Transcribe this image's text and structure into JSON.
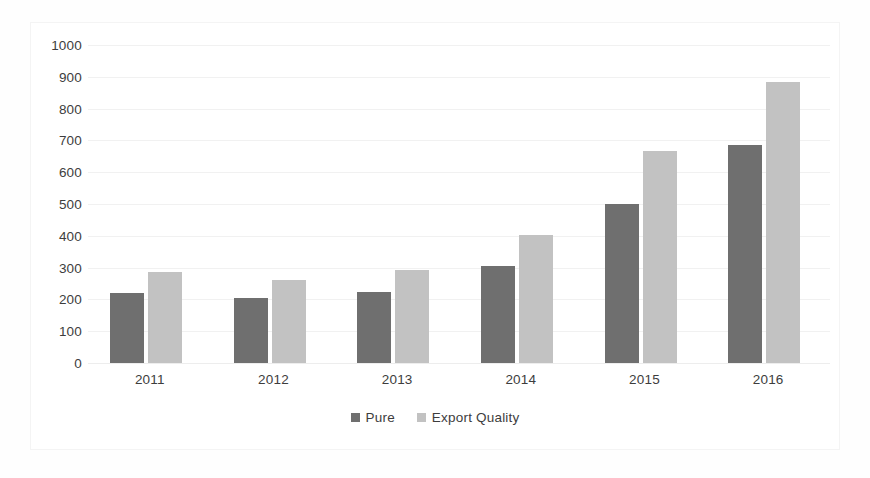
{
  "chart_data": {
    "type": "bar",
    "title": "",
    "subtitle": "",
    "xlabel": "",
    "ylabel": "",
    "categories": [
      "2011",
      "2012",
      "2013",
      "2014",
      "2015",
      "2016"
    ],
    "series": [
      {
        "name": "Pure",
        "color": "#6f6f6f",
        "values": [
          220,
          205,
          222,
          305,
          500,
          685
        ]
      },
      {
        "name": "Export Quality",
        "color": "#c2c2c2",
        "values": [
          285,
          262,
          293,
          403,
          668,
          883
        ]
      }
    ],
    "ylim": [
      0,
      1000
    ],
    "ytick_step": 100,
    "yticks": [
      "0",
      "100",
      "200",
      "300",
      "400",
      "500",
      "600",
      "700",
      "800",
      "900",
      "1000"
    ],
    "grid": true,
    "grid_axis": "y",
    "legend_position": "bottom-center",
    "background_color": "#ffffff",
    "gridline_color": "#f1f1f1",
    "tick_label_color": "#3d3d3d"
  }
}
